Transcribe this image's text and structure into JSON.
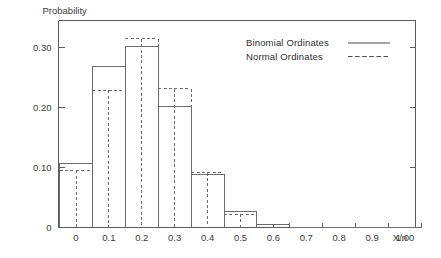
{
  "chart_data": {
    "type": "bar",
    "title": "",
    "ylabel": "Probability",
    "xlabel": "X/n",
    "grid": false,
    "legend_position": "top-right",
    "xlim": [
      -0.05,
      1.05
    ],
    "ylim": [
      0,
      0.345
    ],
    "categories": [
      "0",
      "0.1",
      "0.2",
      "0.3",
      "0.4",
      "0.5",
      "0.6",
      "0.7",
      "0.8",
      "0.9",
      "1.00"
    ],
    "x": [
      0.0,
      0.1,
      0.2,
      0.3,
      0.4,
      0.5,
      0.6,
      0.7,
      0.8,
      0.9,
      1.0
    ],
    "xtick_labels": [
      "0",
      "0.1",
      "0.2",
      "0.3",
      "0.4",
      "0.5",
      "0.6",
      "0.7",
      "0.8",
      "0.9",
      "1.00"
    ],
    "ytick_labels": [
      "0",
      "0.10",
      "0.20",
      "0.30"
    ],
    "ytick_values": [
      0,
      0.1,
      0.2,
      0.3
    ],
    "bar_width": 0.1,
    "series": [
      {
        "name": "Binomial Ordinates",
        "style": "solid",
        "color": "#6b6b6b",
        "values": [
          0.107,
          0.268,
          0.302,
          0.201,
          0.088,
          0.026,
          0.0055,
          0.0008,
          0.0001,
          0.0,
          0.0
        ]
      },
      {
        "name": "Normal Ordinates",
        "style": "dashed",
        "color": "#6b6b6b",
        "values": [
          0.0955,
          0.2285,
          0.3145,
          0.2315,
          0.0915,
          0.0225,
          0.0045,
          0.0007,
          0.0001,
          0.0,
          0.0
        ]
      }
    ]
  },
  "legend": {
    "entries": [
      {
        "label": "Binomial Ordinates",
        "style": "solid"
      },
      {
        "label": "Normal Ordinates",
        "style": "dashed"
      }
    ]
  },
  "axes": {
    "y_caption": "Probability",
    "x_caption": "X/n"
  }
}
